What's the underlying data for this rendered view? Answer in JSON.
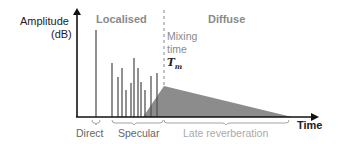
{
  "diagram": {
    "y_axis_label_line1": "Amplitude",
    "y_axis_label_line2": "(dB)",
    "x_axis_label": "Time",
    "region_left": "Localised",
    "region_right": "Diffuse",
    "mixing_label_line1": "Mixing",
    "mixing_label_line2": "time",
    "mixing_symbol": "Tm",
    "segments": [
      {
        "label": "Direct"
      },
      {
        "label": "Specular"
      },
      {
        "label": "Late reverberation"
      }
    ],
    "colors": {
      "axis": "#111111",
      "spike": "#555555",
      "tail_fill": "#8c8c8c",
      "grey_text": "#8a8a8a",
      "dark_text": "#222222"
    }
  }
}
